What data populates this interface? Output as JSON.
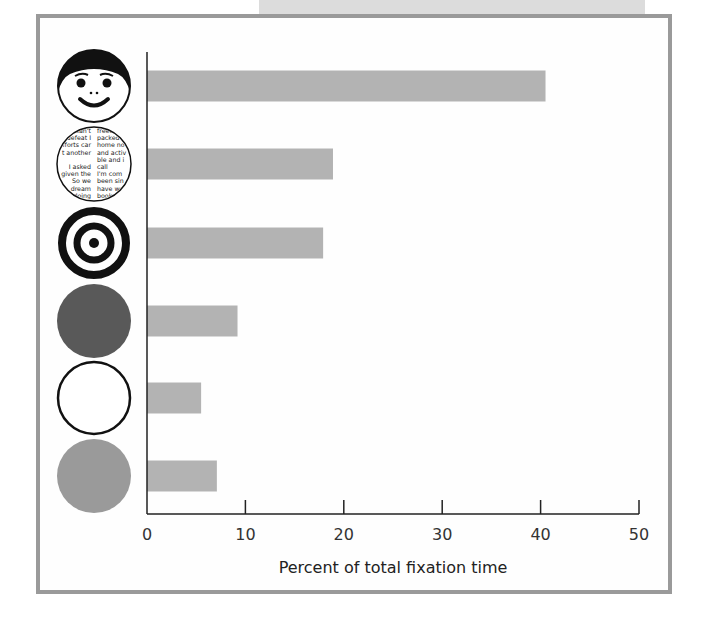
{
  "chart_data": {
    "type": "bar",
    "orientation": "horizontal",
    "title": "",
    "xlabel": "Percent of total fixation time",
    "ylabel": "",
    "xlim": [
      0,
      50
    ],
    "xticks": [
      0,
      10,
      20,
      30,
      40,
      50
    ],
    "grid": false,
    "legend": null,
    "categories": [
      "face",
      "printed text",
      "bull's-eye",
      "dark circle",
      "white circle",
      "gray circle"
    ],
    "values": [
      40.5,
      18.9,
      17.9,
      9.2,
      5.5,
      7.1
    ],
    "category_icons": [
      "face-icon",
      "text-pattern-icon",
      "bullseye-icon",
      "dark-disc-icon",
      "outline-circle-icon",
      "gray-disc-icon"
    ]
  },
  "axis": {
    "title": "Percent of total fixation time",
    "ticks": [
      "0",
      "10",
      "20",
      "30",
      "40",
      "50"
    ]
  },
  "colors": {
    "bar": "#b3b3b3",
    "frame": "#9a9a9a",
    "dark_disc": "#595959",
    "gray_disc": "#9a9a9a"
  },
  "text_pattern": {
    "left": [
      "can't",
      "defeat I",
      "efforts car",
      "t another",
      "",
      "I asked",
      "given the",
      "So we",
      "dream",
      "doing"
    ],
    "right": [
      "freedo",
      "packed",
      "home no",
      "and activ",
      "ble and i",
      "call",
      "I'm com",
      "been sin",
      "have we",
      "book"
    ]
  }
}
